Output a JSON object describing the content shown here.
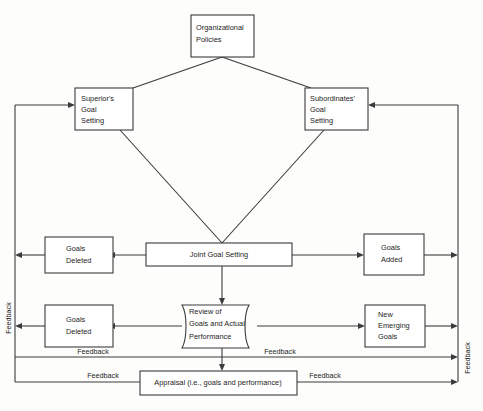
{
  "diagram": {
    "colors": {
      "stroke": "#3b3b3b",
      "box_fill": "#ffffff",
      "page": "#fdfdfc",
      "text": "#1d1d1d"
    },
    "nodes": {
      "organizational_policies": {
        "line1": "Organizational",
        "line2": "Policies"
      },
      "superiors_goal_setting": {
        "line1": "Superior's",
        "line2": "Goal",
        "line3": "Setting"
      },
      "subordinates_goal_setting": {
        "line1": "Subordinates'",
        "line2": "Goal",
        "line3": "Setting"
      },
      "goals_deleted_upper": {
        "line1": "Goals",
        "line2": "Deleted"
      },
      "joint_goal_setting": {
        "line1": "Joint Goal Setting"
      },
      "goals_added": {
        "line1": "Goals",
        "line2": "Added"
      },
      "goals_deleted_lower": {
        "line1": "Goals",
        "line2": "Deleted"
      },
      "review": {
        "line1": "Review of",
        "line2": "Goals and Actual",
        "line3": "Performance"
      },
      "new_emerging_goals": {
        "line1": "New",
        "line2": "Emerging",
        "line3": "Goals"
      },
      "appraisal": {
        "line1": "Appraisal (i.e., goals and performance)"
      }
    },
    "labels": {
      "feedback_left_vertical": "Feedback",
      "feedback_right_vertical": "Feedback",
      "feedback_mid_left": "Feedback",
      "feedback_mid_right": "Feedback",
      "feedback_bottom_left": "Feedback",
      "feedback_bottom_right": "Feedback"
    }
  }
}
